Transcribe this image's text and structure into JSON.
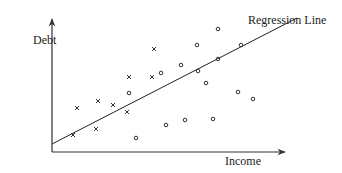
{
  "chart_data": {
    "type": "scatter",
    "title": "",
    "xlabel": "Income",
    "ylabel": "Debt",
    "annotation": "Regression Line",
    "grid": false,
    "legend": null,
    "axes": {
      "origin_px": [
        52,
        152
      ],
      "x_end_px": [
        285,
        152
      ],
      "y_end_px": [
        52,
        19
      ]
    },
    "regression_line_px": [
      [
        52,
        144
      ],
      [
        297,
        18
      ]
    ],
    "series": [
      {
        "name": "x",
        "marker": "x",
        "points_px": [
          [
            154,
            49
          ],
          [
            129,
            77
          ],
          [
            152,
            77
          ],
          [
            77,
            108
          ],
          [
            98,
            101
          ],
          [
            113,
            105
          ],
          [
            127,
            112
          ],
          [
            73,
            135
          ],
          [
            96,
            129
          ]
        ]
      },
      {
        "name": "o",
        "marker": "o",
        "points_px": [
          [
            218,
            29
          ],
          [
            197,
            45
          ],
          [
            241,
            45
          ],
          [
            181,
            65
          ],
          [
            218,
            59
          ],
          [
            161,
            73
          ],
          [
            129,
            93
          ],
          [
            198,
            71
          ],
          [
            206,
            83
          ],
          [
            238,
            92
          ],
          [
            185,
            120
          ],
          [
            166,
            125
          ],
          [
            136,
            138
          ],
          [
            213,
            119
          ],
          [
            253,
            99
          ]
        ]
      }
    ]
  },
  "labels": {
    "ylabel": "Debt",
    "xlabel": "Income",
    "annotation": "Regression Line"
  },
  "colors": {
    "axis": "#333333",
    "line": "#222222",
    "text": "#222222"
  }
}
